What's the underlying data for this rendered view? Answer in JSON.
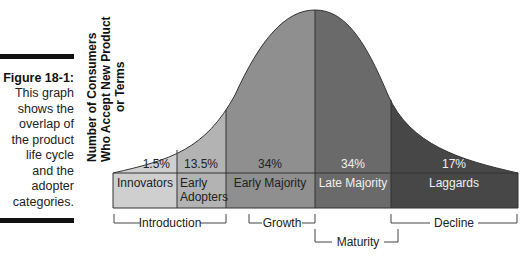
{
  "caption": {
    "title": "Figure 18-1:",
    "lines": [
      "This graph",
      "shows the",
      "overlap of",
      "the product",
      "life cycle",
      "and the",
      "adopter",
      "categories."
    ]
  },
  "y_axis_label": {
    "line1": "Number of Consumers",
    "line2": "Who Accept New Product",
    "line3": "or Terms"
  },
  "adopter_categories": [
    {
      "name": "Innovators",
      "name2": "",
      "percent": "1.5%",
      "color": "#cfcfcf"
    },
    {
      "name": "Early",
      "name2": "Adopters",
      "percent": "13.5%",
      "color": "#b3b3b3"
    },
    {
      "name": "Early Majority",
      "name2": "",
      "percent": "34%",
      "color": "#8f8f8f"
    },
    {
      "name": "Late Majority",
      "name2": "",
      "percent": "34%",
      "color": "#6a6a6a"
    },
    {
      "name": "Laggards",
      "name2": "",
      "percent": "17%",
      "color": "#474747"
    }
  ],
  "life_cycle_stages": [
    {
      "name": "Introduction"
    },
    {
      "name": "Growth"
    },
    {
      "name": "Maturity"
    },
    {
      "name": "Decline"
    }
  ]
}
